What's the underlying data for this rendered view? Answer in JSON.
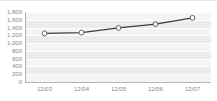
{
  "chart_data": {
    "type": "line",
    "title": "",
    "xlabel": "",
    "ylabel": "",
    "categories": [
      "12/03",
      "12/04",
      "12/05",
      "12/06",
      "12/07"
    ],
    "values": [
      1250,
      1270,
      1390,
      1490,
      1650
    ],
    "series": [
      {
        "name": "series-1",
        "values": [
          1250,
          1270,
          1390,
          1490,
          1650
        ]
      }
    ],
    "ylim": [
      0,
      1800
    ],
    "y_ticks": [
      "0",
      "200",
      "400",
      "600",
      "800",
      "1,000",
      "1,200",
      "1,400",
      "1,600",
      "1,800"
    ],
    "y_tick_values": [
      0,
      200,
      400,
      600,
      800,
      1000,
      1200,
      1400,
      1600,
      1800
    ],
    "x_ticks": [
      "12/03",
      "12/04",
      "12/05",
      "12/06",
      "12/07"
    ],
    "grid": true,
    "legend": false,
    "legend_position": "none",
    "colors": {
      "line": "#3d3d3d",
      "marker_fill": "#ffffff",
      "marker_stroke": "#555555",
      "plot_background": "#f4f4f4",
      "band": "#ebebeb",
      "gridline": "#ffffff",
      "axis": "#b4b4b4",
      "tick_label": "#888888"
    },
    "marker": "circle"
  }
}
